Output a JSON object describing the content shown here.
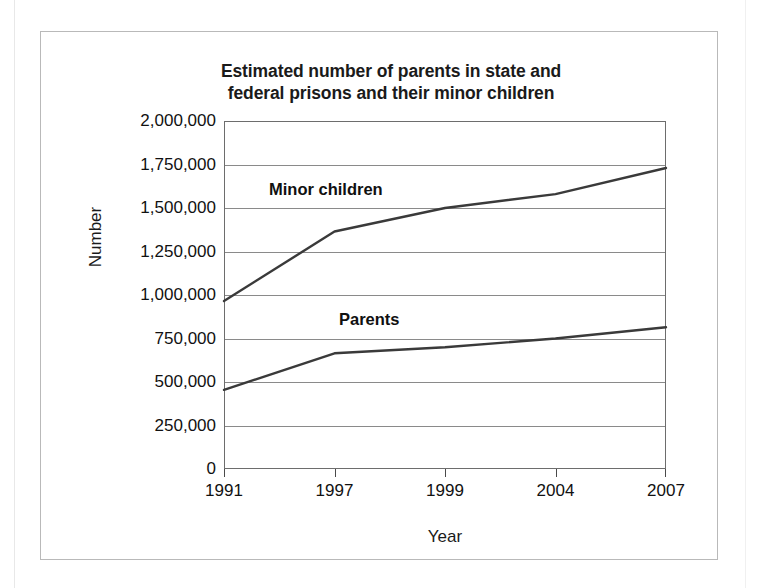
{
  "chart_data": {
    "type": "line",
    "title": "Estimated number of parents in state and federal prisons and their minor children",
    "title_line1": "Estimated number of parents in state and",
    "title_line2": "federal prisons and their minor children",
    "xlabel": "Year",
    "ylabel": "Number",
    "categories": [
      "1991",
      "1997",
      "1999",
      "2004",
      "2007"
    ],
    "x": [
      1991,
      1997,
      1999,
      2004,
      2007
    ],
    "ylim": [
      0,
      2000000
    ],
    "yticks": [
      2000000,
      1750000,
      1500000,
      1250000,
      1000000,
      750000,
      500000,
      250000,
      0
    ],
    "ytick_labels": [
      "2,000,000",
      "1,750,000",
      "1,500,000",
      "1,250,000",
      "1,000,000",
      "750,000",
      "500,000",
      "250,000",
      "0"
    ],
    "grid": true,
    "legend_position": "inline-annotation",
    "series": [
      {
        "name": "Minor children",
        "values": [
          965000,
          1365000,
          1500000,
          1580000,
          1730000
        ],
        "color": "#3a3a3a",
        "annotation": "Minor children"
      },
      {
        "name": "Parents",
        "values": [
          455000,
          665000,
          700000,
          750000,
          815000
        ],
        "color": "#3a3a3a",
        "annotation": "Parents"
      }
    ]
  },
  "figure": {
    "frame_color": "#b9b9b9",
    "axis_color": "#6d6d6d",
    "gridline_color": "#8a8a8a",
    "background": "#ffffff"
  }
}
